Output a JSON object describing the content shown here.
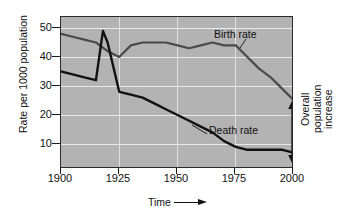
{
  "chart_data": {
    "type": "line",
    "title": "",
    "xlabel": "Time",
    "ylabel": "Rate per 1000 population",
    "xlim": [
      1900,
      2000
    ],
    "ylim": [
      0,
      53
    ],
    "xticks": [
      1900,
      1925,
      1950,
      1975,
      2000
    ],
    "yticks": [
      10,
      20,
      30,
      40,
      50
    ],
    "grid": true,
    "legend_position": "inline-annotations",
    "series": [
      {
        "name": "Birth rate",
        "color": "#4a4a4a",
        "x": [
          1900,
          1905,
          1910,
          1915,
          1920,
          1925,
          1930,
          1935,
          1940,
          1945,
          1950,
          1955,
          1960,
          1965,
          1970,
          1975,
          1980,
          1985,
          1990,
          1995,
          2000
        ],
        "values": [
          48,
          47,
          46,
          45,
          42,
          40,
          44,
          45,
          45,
          45,
          44,
          43,
          44,
          45,
          44,
          44,
          40,
          36,
          33,
          29,
          25
        ]
      },
      {
        "name": "Death rate",
        "color": "#111111",
        "x": [
          1900,
          1905,
          1910,
          1915,
          1918,
          1920,
          1925,
          1930,
          1935,
          1940,
          1945,
          1950,
          1955,
          1960,
          1965,
          1970,
          1975,
          1980,
          1985,
          1990,
          1995,
          2000
        ],
        "values": [
          35,
          34,
          33,
          32,
          49,
          45,
          28,
          27,
          26,
          24,
          22,
          20,
          18,
          16,
          14,
          11,
          9,
          8,
          8,
          8,
          8,
          7
        ]
      }
    ],
    "annotations": [
      {
        "name": "birth-rate-label",
        "text": "Birth rate",
        "x": 1975,
        "y": 50
      },
      {
        "name": "death-rate-label",
        "text": "Death rate",
        "x": 1962,
        "y": 17
      },
      {
        "name": "overall-population-increase-label",
        "text": "Overall population increase",
        "lines": [
          "Overall",
          "population",
          "increase"
        ],
        "x": 2000,
        "y_top": 25,
        "y_bottom": 7
      }
    ]
  },
  "axis": {
    "y_title": "Rate per 1000 population",
    "x_title": "Time",
    "y_tick_labels": [
      "50",
      "40",
      "30",
      "20",
      "10"
    ],
    "x_tick_labels": [
      "1900",
      "1925",
      "1950",
      "1975",
      "2000"
    ]
  },
  "labels": {
    "birth_rate": "Birth rate",
    "death_rate": "Death rate",
    "overall_1": "Overall",
    "overall_2": "population",
    "overall_3": "increase"
  },
  "colors": {
    "plot_background": "#b3b3b3",
    "page_background": "#ffffff",
    "birth_rate_line": "#4a4a4a",
    "death_rate_line": "#111111",
    "gridline": "#e9e9e9",
    "frame": "#2b2b2b",
    "text": "#111111"
  }
}
